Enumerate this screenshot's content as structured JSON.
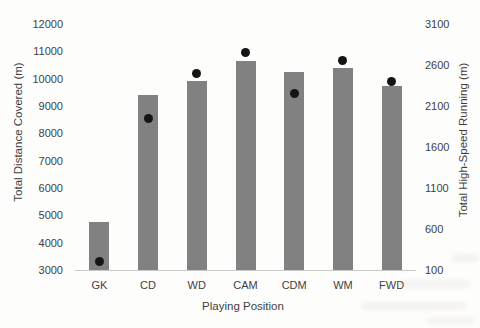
{
  "chart_data": {
    "type": "bar",
    "categories": [
      "GK",
      "CD",
      "WD",
      "CAM",
      "CDM",
      "WM",
      "FWD"
    ],
    "series": [
      {
        "name": "Total Distance Covered (m)",
        "type": "bar",
        "axis": "left",
        "color": "#818181",
        "values": [
          4750,
          9400,
          9900,
          10650,
          10250,
          10400,
          9750
        ]
      },
      {
        "name": "Total High-Speed Running (m)",
        "type": "scatter",
        "axis": "right",
        "color": "#141414",
        "values": [
          200,
          1950,
          2500,
          2750,
          2250,
          2650,
          2400
        ]
      }
    ],
    "title": "",
    "xlabel": "Playing Position",
    "ylabel_left": "Total Distance Covered (m)",
    "ylabel_right": "Total High-Speed Running (m)",
    "left_axis": {
      "min": 3000,
      "max": 12000,
      "step": 1000,
      "ticks": [
        "12000",
        "11000",
        "10000",
        "9000",
        "8000",
        "7000",
        "6000",
        "5000",
        "4000",
        "3000"
      ]
    },
    "right_axis": {
      "min": 100,
      "max": 3100,
      "step": 500,
      "ticks": [
        "3100",
        "2600",
        "2100",
        "1600",
        "1100",
        "600",
        "100"
      ]
    },
    "grid": false,
    "legend": false
  }
}
